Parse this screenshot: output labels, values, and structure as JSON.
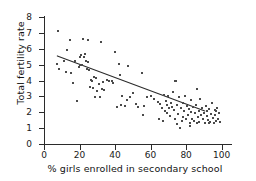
{
  "chart_data": {
    "type": "scatter",
    "title": "",
    "xlabel": "% girls enrolled in secondary school",
    "ylabel": "Total fertility rate",
    "xlim": [
      0,
      103
    ],
    "ylim": [
      0,
      8
    ],
    "xticks": [
      0,
      20,
      40,
      60,
      80,
      100
    ],
    "yticks": [
      0,
      1,
      2,
      3,
      4,
      5,
      6,
      7,
      8
    ],
    "grid": false,
    "legend": null,
    "marker": {
      "shape": "square",
      "color": "#4a4a4a",
      "size_px": 2
    },
    "trendline": {
      "type": "linear",
      "color": "#2b2b2b",
      "x_start": 7.5,
      "y_start": 5.55,
      "x_end": 90.5,
      "y_end": 2.08
    },
    "points": [
      [
        8.0,
        7.1
      ],
      [
        7.5,
        5.05
      ],
      [
        8.5,
        4.75
      ],
      [
        11.5,
        5.2
      ],
      [
        12.5,
        4.55
      ],
      [
        13.0,
        5.9
      ],
      [
        14.5,
        6.55
      ],
      [
        15.0,
        4.45
      ],
      [
        16.5,
        3.85
      ],
      [
        17.5,
        5.25
      ],
      [
        18.5,
        2.7
      ],
      [
        19.5,
        4.85
      ],
      [
        20.0,
        4.95
      ],
      [
        20.5,
        5.45
      ],
      [
        21.0,
        5.6
      ],
      [
        21.5,
        4.95
      ],
      [
        22.0,
        6.6
      ],
      [
        22.5,
        5.45
      ],
      [
        23.0,
        5.7
      ],
      [
        23.5,
        5.25
      ],
      [
        24.0,
        4.75
      ],
      [
        24.5,
        6.55
      ],
      [
        25.0,
        5.15
      ],
      [
        25.5,
        4.65
      ],
      [
        26.0,
        3.6
      ],
      [
        26.5,
        4.05
      ],
      [
        27.0,
        3.95
      ],
      [
        27.5,
        3.55
      ],
      [
        28.0,
        4.25
      ],
      [
        28.5,
        2.95
      ],
      [
        29.0,
        4.15
      ],
      [
        30.0,
        3.35
      ],
      [
        31.0,
        3.8
      ],
      [
        31.5,
        2.95
      ],
      [
        32.0,
        6.45
      ],
      [
        32.5,
        3.45
      ],
      [
        33.0,
        3.9
      ],
      [
        34.0,
        3.4
      ],
      [
        35.5,
        4.05
      ],
      [
        36.5,
        3.95
      ],
      [
        38.0,
        4.0
      ],
      [
        39.0,
        3.85
      ],
      [
        40.0,
        5.8
      ],
      [
        41.0,
        2.35
      ],
      [
        42.0,
        5.05
      ],
      [
        43.0,
        4.35
      ],
      [
        43.5,
        2.45
      ],
      [
        44.0,
        3.0
      ],
      [
        45.5,
        2.4
      ],
      [
        46.5,
        2.75
      ],
      [
        47.5,
        4.9
      ],
      [
        48.5,
        2.95
      ],
      [
        50.0,
        3.2
      ],
      [
        51.5,
        2.55
      ],
      [
        53.0,
        2.35
      ],
      [
        55.0,
        4.45
      ],
      [
        55.5,
        1.8
      ],
      [
        56.5,
        2.4
      ],
      [
        58.0,
        2.95
      ],
      [
        60.0,
        3.05
      ],
      [
        62.0,
        2.85
      ],
      [
        64.0,
        2.65
      ],
      [
        65.5,
        2.55
      ],
      [
        66.5,
        2.25
      ],
      [
        67.0,
        1.45
      ],
      [
        67.5,
        3.1
      ],
      [
        68.0,
        2.05
      ],
      [
        68.5,
        2.7
      ],
      [
        69.0,
        1.95
      ],
      [
        69.5,
        2.45
      ],
      [
        70.0,
        3.0
      ],
      [
        70.5,
        2.25
      ],
      [
        71.0,
        1.75
      ],
      [
        71.5,
        2.6
      ],
      [
        72.0,
        2.35
      ],
      [
        72.5,
        3.3
      ],
      [
        73.0,
        2.15
      ],
      [
        73.5,
        1.55
      ],
      [
        74.0,
        4.0
      ],
      [
        74.5,
        3.95
      ],
      [
        75.0,
        2.45
      ],
      [
        75.5,
        1.9
      ],
      [
        76.0,
        2.95
      ],
      [
        76.5,
        1.0
      ],
      [
        77.0,
        2.25
      ],
      [
        77.5,
        1.45
      ],
      [
        78.0,
        2.6
      ],
      [
        78.5,
        1.7
      ],
      [
        79.0,
        2.1
      ],
      [
        79.5,
        3.05
      ],
      [
        80.0,
        1.55
      ],
      [
        80.5,
        2.4
      ],
      [
        81.0,
        1.85
      ],
      [
        81.5,
        2.2
      ],
      [
        82.0,
        1.35
      ],
      [
        82.5,
        2.0
      ],
      [
        83.0,
        2.75
      ],
      [
        83.5,
        1.6
      ],
      [
        84.0,
        2.3
      ],
      [
        84.5,
        1.45
      ],
      [
        85.0,
        1.95
      ],
      [
        85.5,
        2.45
      ],
      [
        86.0,
        3.45
      ],
      [
        86.5,
        1.7
      ],
      [
        87.0,
        2.1
      ],
      [
        87.5,
        1.4
      ],
      [
        88.0,
        2.85
      ],
      [
        88.5,
        1.85
      ],
      [
        89.0,
        2.25
      ],
      [
        89.5,
        1.55
      ],
      [
        90.0,
        1.95
      ],
      [
        90.5,
        1.35
      ],
      [
        91.0,
        2.4
      ],
      [
        91.5,
        1.75
      ],
      [
        92.0,
        2.05
      ],
      [
        92.5,
        1.5
      ],
      [
        93.0,
        2.2
      ],
      [
        93.5,
        1.4
      ],
      [
        94.0,
        1.9
      ],
      [
        94.5,
        2.6
      ],
      [
        95.0,
        1.65
      ],
      [
        95.5,
        1.35
      ],
      [
        96.0,
        2.15
      ],
      [
        96.5,
        1.8
      ],
      [
        97.0,
        1.45
      ],
      [
        97.5,
        2.25
      ],
      [
        98.0,
        1.55
      ],
      [
        98.5,
        1.95
      ],
      [
        99.0,
        1.4
      ],
      [
        75.0,
        1.25
      ],
      [
        82.0,
        1.15
      ],
      [
        86.0,
        1.3
      ],
      [
        93.0,
        1.3
      ],
      [
        97.0,
        2.05
      ],
      [
        64.5,
        1.55
      ]
    ]
  }
}
